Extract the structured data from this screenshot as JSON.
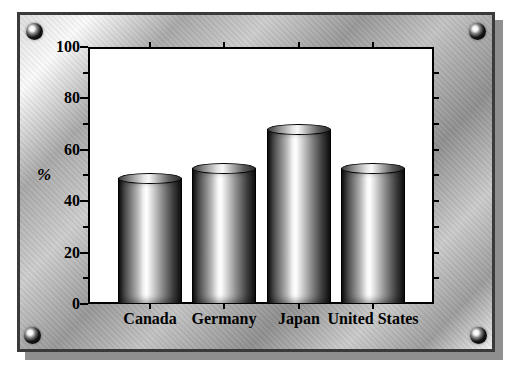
{
  "frame": {
    "style_name": "brushed-metal-frame",
    "border_color": "#3a3a3a",
    "shadow_color": "#8f8f8f",
    "screw_positions": [
      "top-left",
      "top-right",
      "bottom-left",
      "bottom-right"
    ]
  },
  "chart_data": {
    "type": "bar",
    "categories": [
      "Canada",
      "Germany",
      "Japan",
      "United States"
    ],
    "values": [
      51,
      55,
      70,
      55
    ],
    "title": "",
    "xlabel": "",
    "ylabel": "%",
    "ylim": [
      0,
      100
    ],
    "ytick_major": [
      0,
      20,
      40,
      60,
      80,
      100
    ],
    "ytick_minor": [
      10,
      30,
      50,
      70,
      90
    ],
    "ytick_labels": [
      "0",
      "20",
      "40",
      "60",
      "80",
      "100"
    ],
    "right_axis_ticks": [
      10,
      20,
      30,
      40,
      50,
      60,
      70,
      80,
      90
    ],
    "right_axis_labeled": false,
    "grid": false,
    "legend": "none",
    "plot_bg": "#ffffff",
    "axis_color": "#000000",
    "bar_fill": "grayscale-metallic-cylinder"
  }
}
